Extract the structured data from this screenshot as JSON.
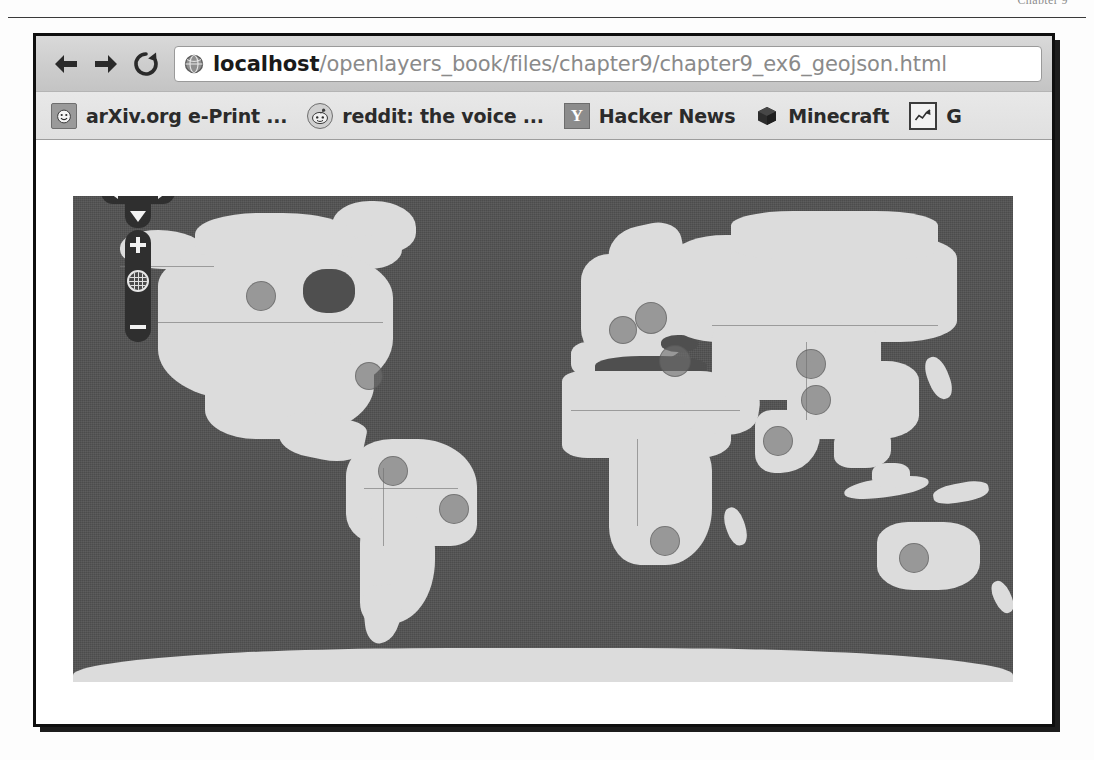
{
  "book_page": {
    "header_text": "Chapter 9",
    "rule": true
  },
  "browser": {
    "toolbar": {
      "back_label": "Back",
      "forward_label": "Forward",
      "reload_label": "Reload",
      "favicon_name": "globe-icon",
      "url_full": "localhost/openlayers_book/files/chapter9/chapter9_ex6_geojson.html",
      "url_host": "localhost",
      "url_path": "/openlayers_book/files/chapter9/chapter9_ex6_geojson.html"
    },
    "bookmarks": [
      {
        "label": "arXiv.org e-Print ...",
        "icon": "smiley-icon"
      },
      {
        "label": "reddit: the voice ...",
        "icon": "reddit-alien-icon"
      },
      {
        "label": "Hacker News",
        "icon": "y-combinator-icon",
        "icon_text": "Y"
      },
      {
        "label": "Minecraft",
        "icon": "cube-icon"
      },
      {
        "label": "G",
        "icon": "chart-icon"
      }
    ]
  },
  "map": {
    "controls": {
      "pan_up_label": "Pan up",
      "pan_down_label": "Pan down",
      "pan_left_label": "Pan left",
      "pan_right_label": "Pan right",
      "zoom_in_label": "+",
      "zoom_out_label": "−",
      "zoom_world_label": "Zoom to max extent"
    },
    "colors": {
      "ocean": "#525252",
      "land": "#dcdcdc",
      "marker_fill": "rgba(110,110,110,.62)",
      "border": "rgba(120,120,120,.65)"
    },
    "markers": [
      {
        "name": "north-america-west",
        "x": 20.0,
        "y": 20.5,
        "r": 15
      },
      {
        "name": "north-america-east",
        "x": 31.5,
        "y": 37.0,
        "r": 14
      },
      {
        "name": "south-america-north",
        "x": 34.0,
        "y": 56.5,
        "r": 15
      },
      {
        "name": "south-america-east",
        "x": 40.5,
        "y": 64.5,
        "r": 15
      },
      {
        "name": "europe-west",
        "x": 58.5,
        "y": 27.5,
        "r": 14
      },
      {
        "name": "europe-central",
        "x": 61.5,
        "y": 25.0,
        "r": 16
      },
      {
        "name": "europe-southeast",
        "x": 64.0,
        "y": 34.0,
        "r": 16
      },
      {
        "name": "africa-south",
        "x": 63.0,
        "y": 71.0,
        "r": 15
      },
      {
        "name": "asia-east-north",
        "x": 78.5,
        "y": 34.5,
        "r": 15
      },
      {
        "name": "asia-east-south",
        "x": 79.0,
        "y": 42.0,
        "r": 15
      },
      {
        "name": "asia-south",
        "x": 75.0,
        "y": 50.5,
        "r": 15
      },
      {
        "name": "australia",
        "x": 89.5,
        "y": 74.5,
        "r": 15
      }
    ]
  }
}
